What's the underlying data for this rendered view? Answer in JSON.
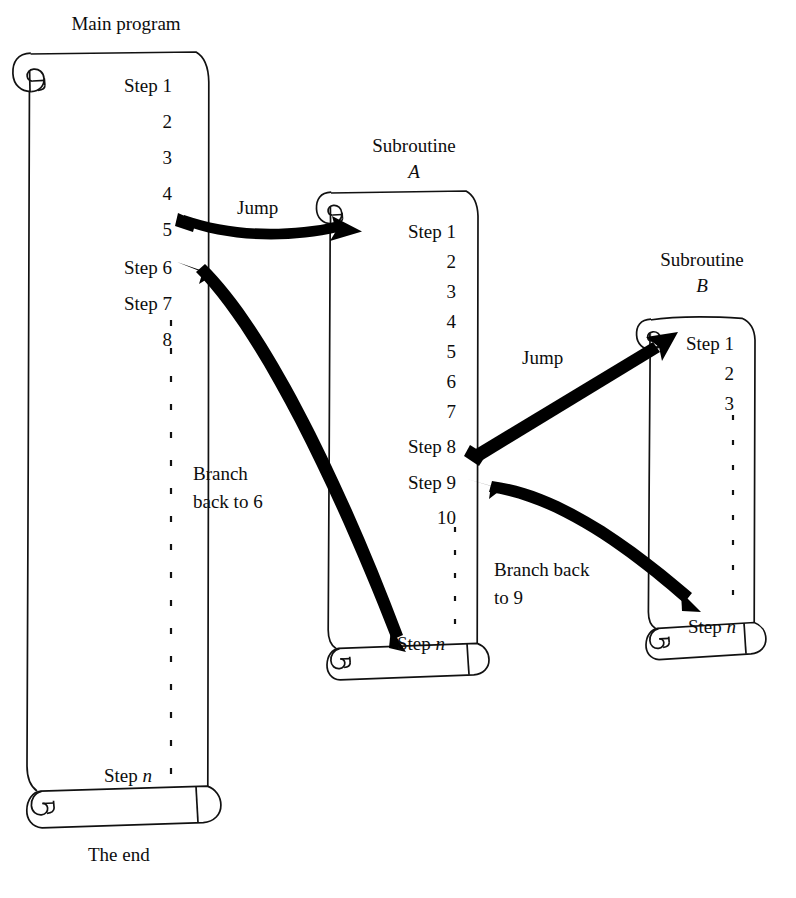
{
  "figure": {
    "caption": ""
  },
  "colors": {
    "ink": "#111111",
    "paper": "#ffffff",
    "arrow": "#000000",
    "caption": "#b9b9b9"
  },
  "scrolls": [
    {
      "id": "main-program",
      "title": "Main program",
      "title_italic": "",
      "steps": [
        "Step 1",
        "2",
        "3",
        "4",
        "5",
        "Step 6",
        "Step 7",
        "8"
      ],
      "ellipsis": true,
      "last_step": "Step n",
      "footer": "The end"
    },
    {
      "id": "subroutine-a",
      "title": "Subroutine",
      "title_italic": "A",
      "steps": [
        "Step 1",
        "2",
        "3",
        "4",
        "5",
        "6",
        "7",
        "Step 8",
        "Step 9",
        "10"
      ],
      "ellipsis": true,
      "last_step": "Step n",
      "footer": ""
    },
    {
      "id": "subroutine-b",
      "title": "Subroutine",
      "title_italic": "B",
      "steps": [
        "Step 1",
        "2",
        "3"
      ],
      "ellipsis": true,
      "last_step": "Step n",
      "footer": ""
    }
  ],
  "arrows": [
    {
      "id": "jump-main-to-a",
      "label": "Jump",
      "from": "main program step 5",
      "to": "subroutine A top"
    },
    {
      "id": "branch-a-to-main",
      "label": "Branch\nback to 6",
      "from": "subroutine A step n",
      "to": "main program step 6"
    },
    {
      "id": "jump-a-to-b",
      "label": "Jump",
      "from": "subroutine A step 8",
      "to": "subroutine B top"
    },
    {
      "id": "branch-b-to-a",
      "label": "Branch back\nto 9",
      "from": "subroutine B step n",
      "to": "subroutine A step 9"
    }
  ]
}
